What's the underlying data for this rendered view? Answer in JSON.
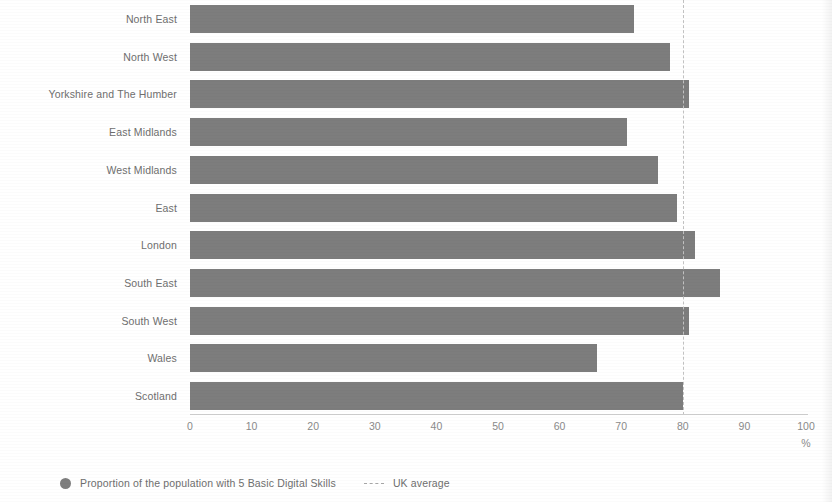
{
  "chart_data": {
    "type": "bar",
    "orientation": "horizontal",
    "title": "",
    "subtitle": "",
    "xlabel": "%",
    "ylabel": "",
    "xlim": [
      0,
      100
    ],
    "xticks": [
      "0",
      "10",
      "20",
      "30",
      "40",
      "50",
      "60",
      "70",
      "80",
      "90",
      "100"
    ],
    "xtick_values": [
      0,
      10,
      20,
      30,
      40,
      50,
      60,
      70,
      80,
      90,
      100
    ],
    "grid": false,
    "legend_position": "bottom-left",
    "categories": [
      "North East",
      "North West",
      "Yorkshire and The Humber",
      "East Midlands",
      "West Midlands",
      "East",
      "London",
      "South East",
      "South West",
      "Wales",
      "Scotland"
    ],
    "series": [
      {
        "name": "Proportion of the population with 5 Basic Digital Skills",
        "color": "#7d7d7d",
        "values": [
          72,
          78,
          81,
          71,
          76,
          79,
          82,
          86,
          81,
          66,
          80
        ]
      }
    ],
    "reference_lines": [
      {
        "name": "UK average",
        "value": 80,
        "color": "#c2c2c2",
        "style": "dashed",
        "orientation": "vertical"
      }
    ],
    "legend": [
      {
        "label": "Proportion of the population with 5 Basic Digital Skills",
        "marker": "circle-marker-icon"
      },
      {
        "label": "UK average",
        "marker": "dashed-line-marker-icon"
      }
    ]
  }
}
